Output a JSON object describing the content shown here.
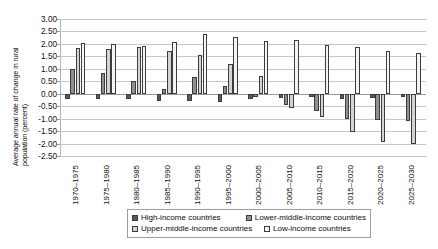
{
  "chart_data": {
    "type": "bar",
    "title": "",
    "subtitle": "",
    "xlabel": "",
    "ylabel": "Average annual rate of change in rural population (percent)",
    "ylabel_line1": "Average annual rate of change in rural",
    "ylabel_line2": "population (percent)",
    "ylim": [
      -2.5,
      3.0
    ],
    "ystep": 0.5,
    "grid": true,
    "legend_position": "bottom",
    "ytick_labels": [
      "3.00",
      "2.50",
      "2.00",
      "1.50",
      "1.00",
      "0.50",
      "0.00",
      "-0.50",
      "-1.00",
      "-1.50",
      "-2.00",
      "-2.50"
    ],
    "ytick_values": [
      3.0,
      2.5,
      2.0,
      1.5,
      1.0,
      0.5,
      0.0,
      -0.5,
      -1.0,
      -1.5,
      -2.0,
      -2.5
    ],
    "categories": [
      "1970–1975",
      "1975–1980",
      "1980–1985",
      "1985–1990",
      "1990–1995",
      "1995–2000",
      "2000–2005",
      "2005–2010",
      "2010–2015",
      "2015–2020",
      "2020–2025",
      "2025–2030"
    ],
    "series": [
      {
        "name": "High-income countries",
        "color": "#595959",
        "values": [
          -0.2,
          -0.2,
          -0.2,
          -0.28,
          -0.3,
          -0.33,
          -0.2,
          -0.18,
          -0.15,
          -0.2,
          -0.18,
          -0.12
        ]
      },
      {
        "name": "Lower-middle-income countries",
        "color": "#8f8f8f",
        "values": [
          0.98,
          0.85,
          0.5,
          0.2,
          0.68,
          0.3,
          -0.12,
          -0.45,
          -0.68,
          -1.0,
          -1.05,
          -1.08
        ]
      },
      {
        "name": "Upper-middle-income countries",
        "color": "#d4d4d4",
        "values": [
          1.85,
          1.8,
          1.88,
          1.72,
          1.55,
          1.18,
          0.72,
          -0.58,
          -0.93,
          -1.55,
          -1.95,
          -2.0
        ]
      },
      {
        "name": "Low-income countries",
        "color": "#f4f4f4",
        "values": [
          2.03,
          2.0,
          1.93,
          2.08,
          2.38,
          2.28,
          2.1,
          2.15,
          1.95,
          1.88,
          1.72,
          1.62
        ]
      }
    ]
  },
  "legend": {
    "items": [
      {
        "label": "High-income countries",
        "color": "#595959"
      },
      {
        "label": "Lower-middle-income countries",
        "color": "#8f8f8f"
      },
      {
        "label": "Upper-middle-income countries",
        "color": "#d4d4d4"
      },
      {
        "label": "Low-income countries",
        "color": "#f4f4f4"
      }
    ]
  }
}
